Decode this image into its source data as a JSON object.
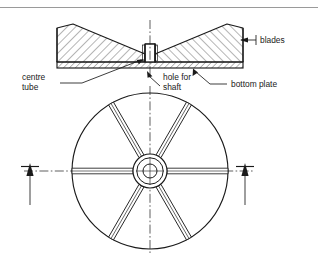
{
  "figure": {
    "title": "",
    "type": "engineering-drawing",
    "views": {
      "section": "cross-section through impeller",
      "plan": "plan view of impeller"
    },
    "colors": {
      "line": "#1a1a1a",
      "hatch": "#1a1a1a",
      "background": "#ffffff",
      "rule": "#9a9a9a"
    },
    "labels": {
      "blades": "blades",
      "centre_tube_line1": "centre",
      "centre_tube_line2": "tube",
      "hole_for_shaft_line1": "hole for",
      "hole_for_shaft_line2": "shaft",
      "bottom_plate": "bottom plate"
    },
    "geometry": {
      "plan_center_x": 150,
      "plan_center_y": 171,
      "plan_outer_radius": 78,
      "hub_outer_radius": 17,
      "hub_mid_radius": 13,
      "hub_hole_radius": 7,
      "blade_count": 6,
      "blade_angles_deg": [
        0,
        60,
        120,
        180,
        240,
        300
      ],
      "section_arrow_left_x": 30,
      "section_arrow_right_x": 245,
      "section_arrow_y": 171
    }
  }
}
